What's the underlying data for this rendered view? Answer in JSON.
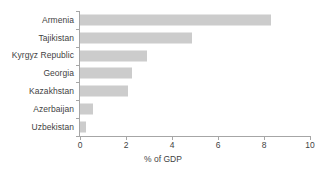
{
  "chart_data": {
    "type": "bar",
    "orientation": "horizontal",
    "title": "",
    "subtitle": "",
    "xlabel": "% of GDP",
    "ylabel": "",
    "categories": [
      "Armenia",
      "Tajikistan",
      "Kyrgyz Republic",
      "Georgia",
      "Kazakhstan",
      "Azerbaijan",
      "Uzbekistan"
    ],
    "values": [
      8.3,
      4.85,
      2.9,
      2.25,
      2.1,
      0.55,
      0.25
    ],
    "xlim": [
      0,
      10
    ],
    "xticks": [
      0,
      2,
      4,
      6,
      8,
      10
    ],
    "xticklabels": [
      "0",
      "2",
      "4",
      "6",
      "8",
      "10"
    ],
    "grid": false,
    "legend": null,
    "bar_color": "#cccccc",
    "axis_color": "#a6a6a6",
    "text_color": "#3f3f3f",
    "background": "#ffffff"
  }
}
